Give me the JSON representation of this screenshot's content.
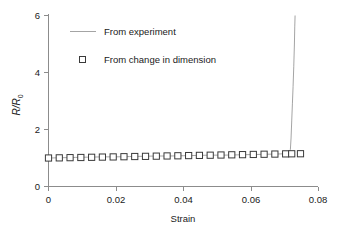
{
  "chart_data": {
    "type": "line",
    "title": "",
    "xlabel": "Strain",
    "ylabel": "R/R0",
    "ylabel_main": "R/R",
    "ylabel_sub": "0",
    "xlim": [
      0,
      0.08
    ],
    "ylim": [
      0,
      6
    ],
    "xticks": [
      0,
      0.02,
      0.04,
      0.06,
      0.08
    ],
    "xtick_labels": [
      "0",
      "0.02",
      "0.04",
      "0.06",
      "0.08"
    ],
    "yticks": [
      0,
      2,
      4,
      6
    ],
    "ytick_labels": [
      "0",
      "2",
      "4",
      "6"
    ],
    "grid": false,
    "legend_position": "upper-left-inside",
    "series": [
      {
        "name": "From experiment",
        "marker": "none",
        "style": "line",
        "x": [
          0,
          0.004,
          0.008,
          0.012,
          0.016,
          0.02,
          0.024,
          0.028,
          0.032,
          0.036,
          0.04,
          0.044,
          0.048,
          0.052,
          0.056,
          0.06,
          0.064,
          0.068,
          0.0705,
          0.0715,
          0.0718,
          0.072,
          0.0722,
          0.0724,
          0.0726,
          0.0728,
          0.073,
          0.0731,
          0.0732
        ],
        "values": [
          1.0,
          1.01,
          1.02,
          1.03,
          1.04,
          1.04,
          1.05,
          1.06,
          1.07,
          1.07,
          1.08,
          1.09,
          1.1,
          1.1,
          1.11,
          1.12,
          1.13,
          1.14,
          1.15,
          1.18,
          1.3,
          1.7,
          2.3,
          2.9,
          3.5,
          4.2,
          5.0,
          5.6,
          6.0
        ]
      },
      {
        "name": "From change in dimension",
        "marker": "square-open",
        "style": "markers",
        "x": [
          0.0,
          0.0032,
          0.0064,
          0.0096,
          0.0128,
          0.016,
          0.0192,
          0.0224,
          0.0256,
          0.0288,
          0.032,
          0.0352,
          0.0384,
          0.0416,
          0.0448,
          0.048,
          0.0512,
          0.0544,
          0.0576,
          0.0608,
          0.064,
          0.0672,
          0.0704,
          0.0722,
          0.0748
        ],
        "values": [
          1.0,
          1.005,
          1.012,
          1.018,
          1.025,
          1.032,
          1.038,
          1.045,
          1.052,
          1.058,
          1.065,
          1.072,
          1.078,
          1.085,
          1.092,
          1.098,
          1.105,
          1.112,
          1.118,
          1.125,
          1.132,
          1.138,
          1.145,
          1.148,
          1.15
        ]
      }
    ],
    "legend_entries": [
      {
        "label": "From experiment",
        "type": "line"
      },
      {
        "label": "From change in dimension",
        "type": "square-open"
      }
    ],
    "colors": {
      "line": "#9a9a9a",
      "marker_stroke": "#3a3a3a",
      "marker_fill": "#ffffff",
      "axis": "#8c8c8c",
      "text": "#1a1a1a",
      "background": "#ffffff"
    }
  }
}
